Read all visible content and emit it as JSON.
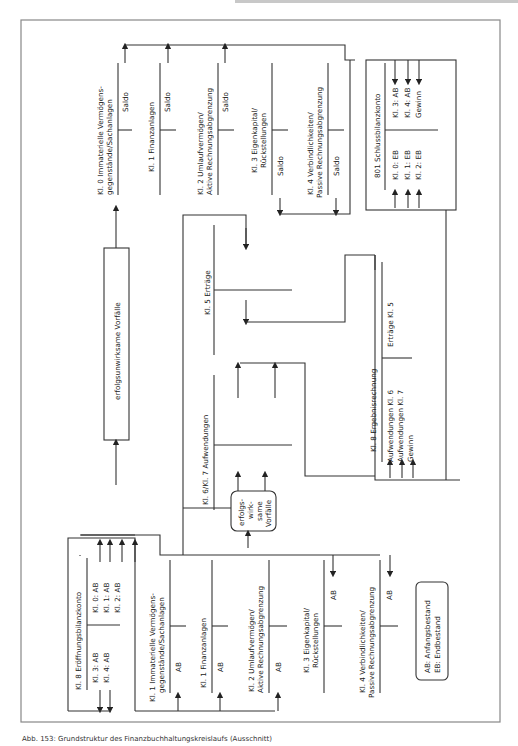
{
  "figure": {
    "caption": "Abb. 153: Grundstruktur des Finanzbuchhaltungskreislaufs (Ausschnitt)",
    "legend": {
      "line1": "AB: Anfangsbestand",
      "line2": "EB: Endbestand"
    },
    "top_accounts": [
      {
        "title1": "Kl. 0 Immaterielle Vermögens-",
        "title2": "gegenstände/Sachanlagen",
        "right": "Saldo"
      },
      {
        "title1": "Kl. 1 Finanzanlagen",
        "title2": "",
        "right": "Saldo"
      },
      {
        "title1": "Kl. 2 Umlaufvermögen/",
        "title2": "Aktive Rechnungsabgrenzung",
        "right": "Saldo"
      },
      {
        "title1": "Kl. 3 Eigenkapital/",
        "title2": "Rückstellungen",
        "left": "Saldo"
      },
      {
        "title1": "Kl. 4 Verbindlichkeiten/",
        "title2": "Passive Rechnungsabgrenzung",
        "left": "Saldo"
      }
    ],
    "schlussbilanz": {
      "title": "801 Schlussbilanzkonto",
      "left": [
        "Kl. 0: EB",
        "Kl. 1: EB",
        "Kl. 2: EB"
      ],
      "right": [
        "Kl. 3: AB",
        "Kl. 4: AB",
        "Gewinn"
      ]
    },
    "erfolgsunwirksam": "erfolgsunwirksame Vorfälle",
    "erfolgswirksam": [
      "erfolgs-",
      "wirk-",
      "same",
      "Vorfälle"
    ],
    "ertraege": {
      "title": "Kl. 5 Erträge"
    },
    "aufwendungen": {
      "title": "Kl. 6/Kl. 7 Aufwendungen"
    },
    "ergebnisrechnung": {
      "title": "Kl. 8 Ergebnisrechnung",
      "left": [
        "Aufwendungen Kl. 6",
        "Aufwendungen Kl. 7",
        "Gewinn"
      ],
      "right": [
        "Erträge Kl. 5"
      ]
    },
    "eroeffnungsbilanz": {
      "title": "Kl. 8 Eröffnungsbilanzkonto",
      "left": [
        "Kl. 3: AB",
        "Kl. 4: AB"
      ],
      "right": [
        "Kl. 0: AB",
        "Kl. 1: AB",
        "Kl. 2: AB"
      ]
    },
    "bottom_accounts": [
      {
        "title1": "Kl. 1 Immaterielle Vermögens-",
        "title2": "gegenstände/Sachanlagen",
        "left": "AB"
      },
      {
        "title1": "Kl. 1 Finanzanlagen",
        "title2": "",
        "left": "AB"
      },
      {
        "title1": "Kl. 2 Umlaufvermögen/",
        "title2": "Aktive Rechnungsabgrenzung",
        "left": "AB"
      },
      {
        "title1": "Kl. 3 Eigenkapital/",
        "title2": "Rückstellungen",
        "right": "AB"
      },
      {
        "title1": "Kl. 4 Verbindlichkeiten/",
        "title2": "Passive Rechnungsabgrenzung",
        "right": "AB"
      }
    ]
  }
}
